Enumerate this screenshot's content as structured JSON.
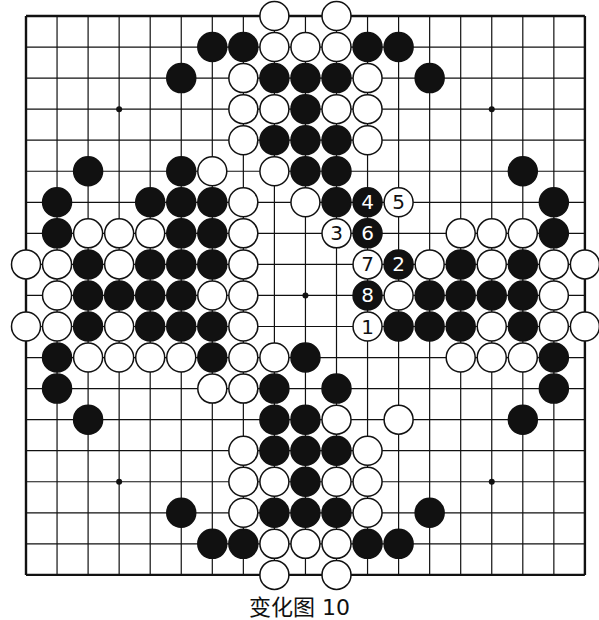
{
  "board": {
    "size": 19,
    "origin_x": 26,
    "origin_y": 16,
    "spacing": 31.05,
    "stone_radius": 14.5,
    "line_color": "#111111",
    "star_points": [
      [
        3,
        3
      ],
      [
        9,
        3
      ],
      [
        15,
        3
      ],
      [
        3,
        9
      ],
      [
        9,
        9
      ],
      [
        15,
        9
      ],
      [
        3,
        15
      ],
      [
        9,
        15
      ],
      [
        15,
        15
      ]
    ],
    "black": [
      [
        6,
        1
      ],
      [
        7,
        1
      ],
      [
        11,
        1
      ],
      [
        12,
        1
      ],
      [
        5,
        2
      ],
      [
        8,
        2
      ],
      [
        9,
        2
      ],
      [
        10,
        2
      ],
      [
        13,
        2
      ],
      [
        9,
        3
      ],
      [
        8,
        4
      ],
      [
        9,
        4
      ],
      [
        10,
        4
      ],
      [
        2,
        5
      ],
      [
        5,
        5
      ],
      [
        9,
        5
      ],
      [
        10,
        5
      ],
      [
        16,
        5
      ],
      [
        1,
        6
      ],
      [
        4,
        6
      ],
      [
        5,
        6
      ],
      [
        6,
        6
      ],
      [
        10,
        6
      ],
      [
        17,
        6
      ],
      [
        1,
        7
      ],
      [
        5,
        7
      ],
      [
        6,
        7
      ],
      [
        17,
        7
      ],
      [
        2,
        8
      ],
      [
        4,
        8
      ],
      [
        5,
        8
      ],
      [
        6,
        8
      ],
      [
        14,
        8
      ],
      [
        16,
        8
      ],
      [
        2,
        9
      ],
      [
        3,
        9
      ],
      [
        4,
        9
      ],
      [
        5,
        9
      ],
      [
        13,
        9
      ],
      [
        14,
        9
      ],
      [
        15,
        9
      ],
      [
        16,
        9
      ],
      [
        2,
        10
      ],
      [
        4,
        10
      ],
      [
        5,
        10
      ],
      [
        6,
        10
      ],
      [
        12,
        10
      ],
      [
        13,
        10
      ],
      [
        14,
        10
      ],
      [
        16,
        10
      ],
      [
        1,
        11
      ],
      [
        6,
        11
      ],
      [
        9,
        11
      ],
      [
        17,
        11
      ],
      [
        1,
        12
      ],
      [
        8,
        12
      ],
      [
        10,
        12
      ],
      [
        17,
        12
      ],
      [
        2,
        13
      ],
      [
        8,
        13
      ],
      [
        9,
        13
      ],
      [
        16,
        13
      ],
      [
        8,
        14
      ],
      [
        9,
        14
      ],
      [
        10,
        14
      ],
      [
        9,
        15
      ],
      [
        5,
        16
      ],
      [
        8,
        16
      ],
      [
        9,
        16
      ],
      [
        10,
        16
      ],
      [
        13,
        16
      ],
      [
        6,
        17
      ],
      [
        7,
        17
      ],
      [
        11,
        17
      ],
      [
        12,
        17
      ]
    ],
    "white": [
      [
        8,
        0
      ],
      [
        10,
        0
      ],
      [
        8,
        1
      ],
      [
        9,
        1
      ],
      [
        10,
        1
      ],
      [
        7,
        2
      ],
      [
        11,
        2
      ],
      [
        7,
        3
      ],
      [
        8,
        3
      ],
      [
        10,
        3
      ],
      [
        11,
        3
      ],
      [
        7,
        4
      ],
      [
        11,
        4
      ],
      [
        6,
        5
      ],
      [
        8,
        5
      ],
      [
        7,
        6
      ],
      [
        9,
        6
      ],
      [
        2,
        7
      ],
      [
        3,
        7
      ],
      [
        4,
        7
      ],
      [
        7,
        7
      ],
      [
        14,
        7
      ],
      [
        15,
        7
      ],
      [
        16,
        7
      ],
      [
        0,
        8
      ],
      [
        1,
        8
      ],
      [
        3,
        8
      ],
      [
        7,
        8
      ],
      [
        13,
        8
      ],
      [
        15,
        8
      ],
      [
        17,
        8
      ],
      [
        18,
        8
      ],
      [
        1,
        9
      ],
      [
        6,
        9
      ],
      [
        7,
        9
      ],
      [
        12,
        9
      ],
      [
        17,
        9
      ],
      [
        0,
        10
      ],
      [
        1,
        10
      ],
      [
        3,
        10
      ],
      [
        7,
        10
      ],
      [
        15,
        10
      ],
      [
        17,
        10
      ],
      [
        18,
        10
      ],
      [
        2,
        11
      ],
      [
        3,
        11
      ],
      [
        4,
        11
      ],
      [
        5,
        11
      ],
      [
        7,
        11
      ],
      [
        8,
        11
      ],
      [
        14,
        11
      ],
      [
        15,
        11
      ],
      [
        16,
        11
      ],
      [
        6,
        12
      ],
      [
        7,
        12
      ],
      [
        10,
        13
      ],
      [
        12,
        13
      ],
      [
        7,
        14
      ],
      [
        11,
        14
      ],
      [
        7,
        15
      ],
      [
        8,
        15
      ],
      [
        10,
        15
      ],
      [
        11,
        15
      ],
      [
        7,
        16
      ],
      [
        11,
        16
      ],
      [
        8,
        17
      ],
      [
        9,
        17
      ],
      [
        10,
        17
      ],
      [
        8,
        18
      ],
      [
        10,
        18
      ]
    ],
    "numbered_moves": [
      {
        "n": "1",
        "color": "white",
        "pos": [
          11,
          10
        ]
      },
      {
        "n": "2",
        "color": "black",
        "pos": [
          12,
          8
        ]
      },
      {
        "n": "3",
        "color": "white",
        "pos": [
          10,
          7
        ]
      },
      {
        "n": "4",
        "color": "black",
        "pos": [
          11,
          6
        ]
      },
      {
        "n": "5",
        "color": "white",
        "pos": [
          12,
          6
        ]
      },
      {
        "n": "6",
        "color": "black",
        "pos": [
          11,
          7
        ]
      },
      {
        "n": "7",
        "color": "white",
        "pos": [
          11,
          8
        ]
      },
      {
        "n": "8",
        "color": "black",
        "pos": [
          11,
          9
        ]
      }
    ]
  },
  "caption": "变化图 10"
}
